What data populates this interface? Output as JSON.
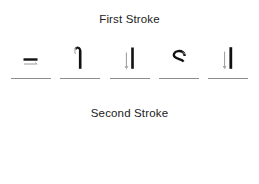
{
  "page": {
    "background_color": "#ffffff",
    "ink_color": "#111111",
    "guide_color": "#9a9a9a",
    "baseline_color": "#8d8d8d",
    "text_color": "#222222"
  },
  "sections": [
    {
      "id": "first-stroke",
      "title": "First Stroke",
      "glyphs": [
        {
          "letter": "e",
          "stroke_name": "e-first-stroke",
          "description": "horizontal crossbar"
        },
        {
          "letter": "f",
          "stroke_name": "f-first-stroke",
          "description": "hooked vertical stem"
        },
        {
          "letter": "k",
          "stroke_name": "k-first-stroke",
          "description": "vertical stem"
        },
        {
          "letter": "s",
          "stroke_name": "s-first-stroke",
          "description": "upper curve"
        },
        {
          "letter": "t",
          "stroke_name": "t-first-stroke",
          "description": "vertical stem"
        }
      ]
    },
    {
      "id": "second-stroke",
      "title": "Second Stroke",
      "glyphs": [
        {
          "letter": "e",
          "stroke_name": "e-complete",
          "description": "completed letter e"
        },
        {
          "letter": "f",
          "stroke_name": "f-complete",
          "description": "completed letter f"
        },
        {
          "letter": "k",
          "stroke_name": "k-complete",
          "description": "completed letter k"
        },
        {
          "letter": "s",
          "stroke_name": "s-complete",
          "description": "completed letter s"
        },
        {
          "letter": "t",
          "stroke_name": "t-complete",
          "description": "completed letter t"
        }
      ]
    }
  ]
}
